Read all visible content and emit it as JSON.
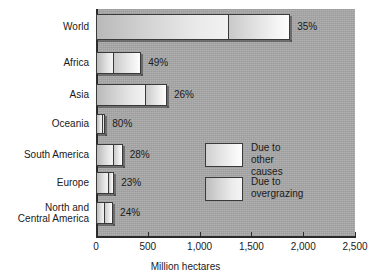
{
  "chart_data": {
    "type": "bar",
    "orientation": "horizontal",
    "stacked": true,
    "title": "",
    "xlabel": "Million hectares",
    "ylabel": "",
    "xlim": [
      0,
      2500
    ],
    "grid": false,
    "legend_position": "middle-right",
    "categories": [
      "World",
      "Africa",
      "Asia",
      "Oceania",
      "South America",
      "Europe",
      "North and\nCentral America"
    ],
    "tick_labels": [
      "0",
      "500",
      "1,000",
      "1,500",
      "2,000",
      "2,500"
    ],
    "tick_values": [
      0,
      500,
      1000,
      1500,
      2000,
      2500
    ],
    "series": [
      {
        "name": "Due to\novergrazing",
        "values": [
          1280,
          169,
          478,
          72,
          177,
          128,
          84
        ]
      },
      {
        "name": "Due to\nother causes",
        "values": [
          595,
          267,
          207,
          18,
          81,
          48,
          81
        ]
      }
    ],
    "data_labels": [
      "35%",
      "49%",
      "26%",
      "80%",
      "28%",
      "23%",
      "24%"
    ],
    "totals": [
      1875,
      436,
      685,
      90,
      258,
      176,
      165
    ],
    "colors": {
      "plot_background": "#a8a8a8",
      "page_background": "#ffffff",
      "axis": "#2b2b2b",
      "segment_overgrazing": "#d8d8d8",
      "segment_other_causes": "#f0f0f0",
      "text": "#1a1a1a"
    }
  },
  "legend": {
    "items": [
      {
        "label": "Due to\nother causes",
        "swatch": "sw-other"
      },
      {
        "label": "Due to\novergrazing",
        "swatch": "sw-over"
      }
    ]
  },
  "axis": {
    "x_title": "Million hectares"
  }
}
